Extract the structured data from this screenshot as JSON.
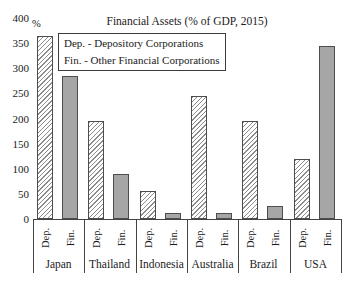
{
  "chart_data": {
    "type": "bar",
    "title": "Financial Assets (% of GDP, 2015)",
    "unit": "%",
    "categories": [
      "Japan",
      "Thailand",
      "Indonesia",
      "Australia",
      "Brazil",
      "USA"
    ],
    "series": [
      {
        "name": "Dep.",
        "legend": "Dep. - Depository Corporations",
        "style": "hatched",
        "values": [
          365,
          195,
          55,
          245,
          195,
          120
        ]
      },
      {
        "name": "Fin.",
        "legend": "Fin. - Other Financial Corporations",
        "style": "solid",
        "values": [
          285,
          90,
          12,
          12,
          25,
          345
        ]
      }
    ],
    "ylim": [
      0,
      400
    ],
    "yticks": [
      0,
      50,
      100,
      150,
      200,
      250,
      300,
      350,
      400
    ],
    "grid": false,
    "legend_position": "upper-left-inside"
  },
  "colors": {
    "solid_bar": "#a6a6a6",
    "hatch_line": "#8c8c8c",
    "bar_border": "#4d4d4d",
    "axis": "#444444",
    "text": "#1a1a1a",
    "background": "#ffffff"
  }
}
